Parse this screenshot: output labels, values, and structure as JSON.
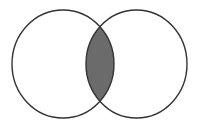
{
  "diagram": {
    "type": "venn",
    "sets": [
      {
        "id": "left",
        "cx": 63,
        "cy": 64,
        "rx": 51,
        "ry": 54
      },
      {
        "id": "right",
        "cx": 136.5,
        "cy": 64,
        "rx": 50.5,
        "ry": 54
      }
    ],
    "highlighted_region": "intersection",
    "colors": {
      "background": "#ffffff",
      "stroke": "#333333",
      "intersection_fill": "#6b6b6b"
    }
  }
}
